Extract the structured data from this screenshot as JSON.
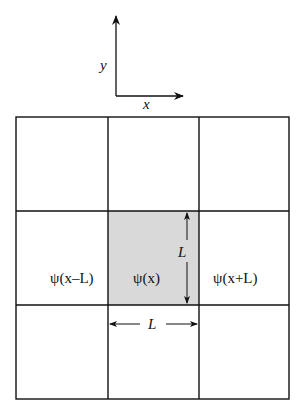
{
  "axes": {
    "x_label": "x",
    "y_label": "y"
  },
  "grid": {
    "rows": 3,
    "cols": 3,
    "shaded_cell": {
      "row": 1,
      "col": 1
    },
    "shade_color": "#d9d9d9",
    "line_color": "#111111"
  },
  "cells": {
    "left": "ψ(x–L)",
    "center": "ψ(x)",
    "right": "ψ(x+L)"
  },
  "dimensions": {
    "vertical_label": "L",
    "horizontal_label": "L"
  }
}
